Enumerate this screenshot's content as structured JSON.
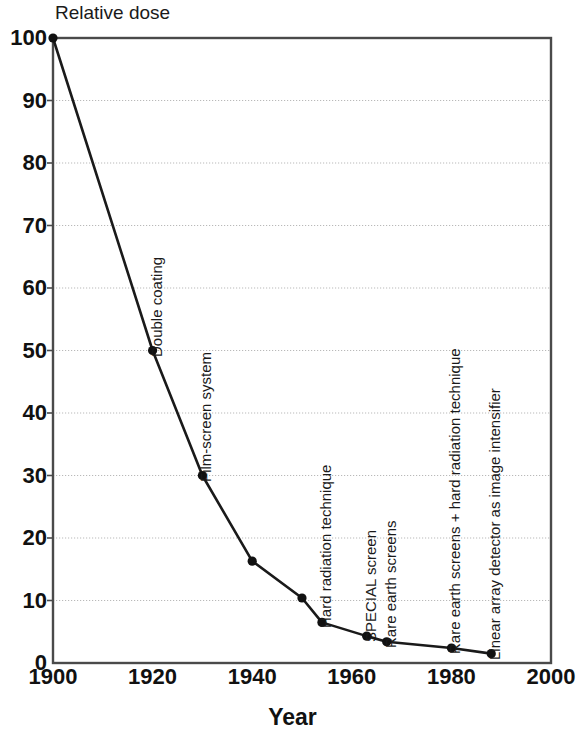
{
  "chart_data": {
    "type": "line",
    "title": "",
    "ylabel": "Relative dose",
    "xlabel": "Year",
    "xlim": [
      1900,
      2000
    ],
    "ylim": [
      0,
      100
    ],
    "grid": true,
    "legend": "none",
    "xticks": [
      1900,
      1920,
      1940,
      1960,
      1980,
      2000
    ],
    "yticks": [
      0,
      10,
      20,
      30,
      40,
      50,
      60,
      70,
      80,
      90,
      100
    ],
    "series": [
      {
        "name": "Relative dose",
        "x": [
          1900,
          1920,
          1930,
          1940,
          1950,
          1954,
          1963,
          1967,
          1980,
          1988
        ],
        "values": [
          100,
          50,
          30,
          16.3,
          10.4,
          6.5,
          4.3,
          3.4,
          2.4,
          1.5
        ]
      }
    ],
    "annotations": [
      {
        "label": "Double coating",
        "x": 1920,
        "y": 50
      },
      {
        "label": "Film-screen system",
        "x": 1930,
        "y": 30
      },
      {
        "label": "Hard radiation technique",
        "x": 1954,
        "y": 6.5
      },
      {
        "label": "SPECIAL screen",
        "x": 1963,
        "y": 4.3
      },
      {
        "label": "Rare earth screens",
        "x": 1967,
        "y": 3.4
      },
      {
        "label": "Rare earth screens + hard radiation technique",
        "x": 1980,
        "y": 2.4
      },
      {
        "label": "Linear array detector as image intensifier",
        "x": 1988,
        "y": 1.5
      }
    ],
    "colors": {
      "line": "#1a1a1a",
      "marker": "#111111",
      "grid": "#b9b9b9",
      "frame": "#4a4a4a",
      "text": "#111111"
    }
  }
}
